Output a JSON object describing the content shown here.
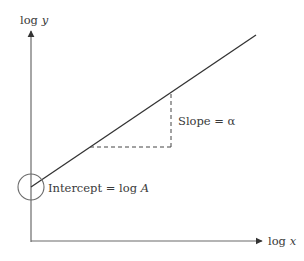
{
  "diagram": {
    "type": "log-log linear relationship",
    "axes": {
      "x_label_prefix": "log ",
      "x_label_var": "x",
      "y_label_prefix": "log ",
      "y_label_var": "y"
    },
    "annotations": {
      "intercept_prefix": "Intercept = log ",
      "intercept_var": "A",
      "slope_text": "Slope = α"
    },
    "colors": {
      "axis": "#6b6b6b",
      "line": "#333333",
      "dashed": "#444444",
      "circle": "#6b6b6b",
      "text": "#3a3a3a"
    }
  }
}
